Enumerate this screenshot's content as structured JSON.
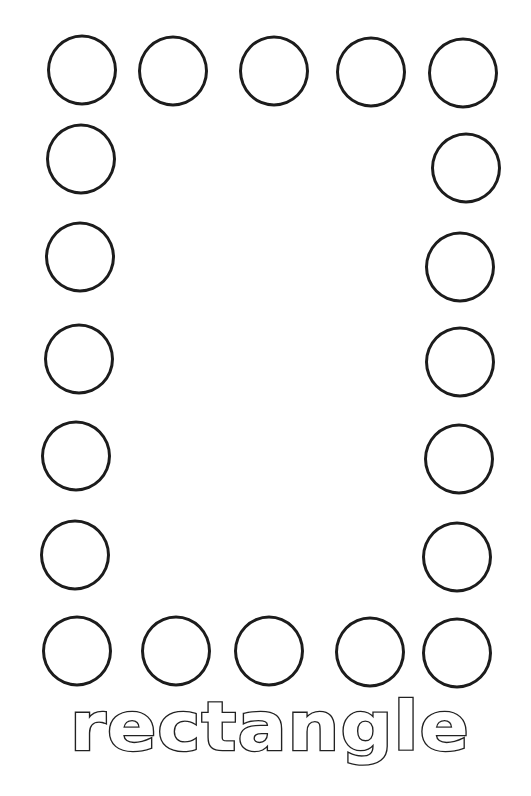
{
  "worksheet": {
    "shape_name": "rectangle",
    "colors": {
      "background": "#ffffff",
      "outline": "#1c1c1c"
    },
    "dots": {
      "top_row": [
        {
          "x": 82,
          "y": 70
        },
        {
          "x": 173,
          "y": 71
        },
        {
          "x": 274,
          "y": 71
        },
        {
          "x": 371,
          "y": 72
        },
        {
          "x": 463,
          "y": 73
        }
      ],
      "left_column": [
        {
          "x": 81,
          "y": 159
        },
        {
          "x": 80,
          "y": 257
        },
        {
          "x": 79,
          "y": 359
        },
        {
          "x": 76,
          "y": 456
        },
        {
          "x": 75,
          "y": 555
        }
      ],
      "right_column": [
        {
          "x": 466,
          "y": 168
        },
        {
          "x": 460,
          "y": 267
        },
        {
          "x": 460,
          "y": 362
        },
        {
          "x": 459,
          "y": 459
        },
        {
          "x": 457,
          "y": 557
        }
      ],
      "bottom_row": [
        {
          "x": 77,
          "y": 651
        },
        {
          "x": 176,
          "y": 651
        },
        {
          "x": 269,
          "y": 651
        },
        {
          "x": 370,
          "y": 652
        },
        {
          "x": 457,
          "y": 653
        }
      ],
      "count": 20
    }
  }
}
